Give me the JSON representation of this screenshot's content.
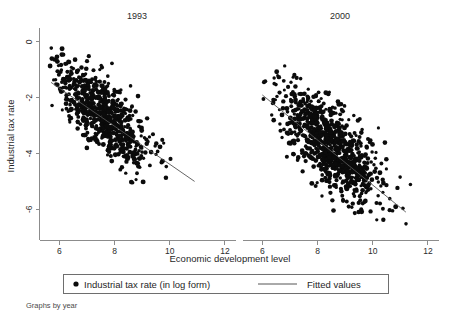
{
  "figure": {
    "note": "Graphs by year",
    "y_axis_title": "Industrial tax rate",
    "x_axis_title": "Economic development level"
  },
  "legend": {
    "marker_label": "Industrial tax rate (in log form)",
    "line_label": "Fitted values",
    "marker_icon": "filled-circle-marker",
    "line_icon": "horizontal-line-marker"
  },
  "colors": {
    "marker": "#0b0b0b",
    "fit_line": "#555555",
    "axis": "#8c8c8c",
    "text": "#1f1f1f",
    "background": "#ffffff"
  },
  "chart_data": {
    "type": "scatter",
    "title": "",
    "xlabel": "Economic development level",
    "ylabel": "Industrial tax rate",
    "grid": false,
    "legend_position": "bottom",
    "xlim": [
      5.3,
      12.4
    ],
    "ylim": [
      -7.1,
      0.5
    ],
    "xticks": [
      6,
      8,
      10,
      12
    ],
    "yticks": [
      0,
      -2,
      -4,
      -6
    ],
    "ytick_labels": [
      "0",
      "-2",
      "-4",
      "-6"
    ],
    "xtick_labels": [
      "6",
      "8",
      "10",
      "12"
    ],
    "panels": [
      {
        "title": "1993",
        "n_points": 720,
        "x_range": [
          5.65,
          10.95
        ],
        "y_range": [
          -5.05,
          -0.05
        ],
        "x_mean": 7.55,
        "y_mean": -2.55,
        "x_sd": 0.86,
        "y_sd": 0.95,
        "correlation": -0.74,
        "fitted_line": {
          "x_start": 5.7,
          "y_start": -1.45,
          "x_end": 10.9,
          "y_end": -5.0,
          "slope": -0.683,
          "intercept": 2.44
        }
      },
      {
        "title": "2000",
        "n_points": 900,
        "x_range": [
          6.0,
          11.45
        ],
        "y_range": [
          -6.65,
          -0.75
        ],
        "x_mean": 8.55,
        "y_mean": -3.75,
        "x_sd": 0.95,
        "y_sd": 1.05,
        "correlation": -0.72,
        "fitted_line": {
          "x_start": 6.0,
          "y_start": -1.9,
          "x_end": 11.2,
          "y_end": -6.1,
          "slope": -0.808,
          "intercept": 2.95
        }
      }
    ]
  }
}
